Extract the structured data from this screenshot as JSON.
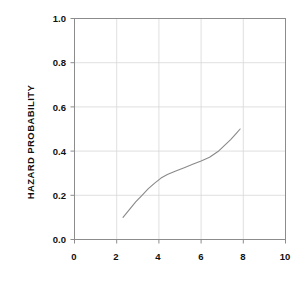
{
  "chart_data": {
    "type": "line",
    "title": "",
    "subtitle": "",
    "xlabel": "",
    "ylabel": "HAZARD PROBABILITY",
    "xlim": [
      0,
      10
    ],
    "ylim": [
      0.0,
      1.0
    ],
    "xticks": [
      "0",
      "2",
      "4",
      "6",
      "8",
      "10"
    ],
    "xtick_values": [
      0,
      2,
      4,
      6,
      8,
      10
    ],
    "yticks": [
      "0.0",
      "0.2",
      "0.4",
      "0.6",
      "0.8",
      "1.0"
    ],
    "ytick_values": [
      0.0,
      0.2,
      0.4,
      0.6,
      0.8,
      1.0
    ],
    "grid": true,
    "legend": "none",
    "line_color": "#8a8a8a",
    "frame_color": "#808080",
    "grid_color": "#d8d8d8",
    "series": [
      {
        "name": "hazard probability",
        "x": [
          2.3,
          2.6,
          2.9,
          3.2,
          3.5,
          3.8,
          4.1,
          4.4,
          4.8,
          5.2,
          5.6,
          6.0,
          6.4,
          6.8,
          7.1,
          7.4,
          7.7,
          7.85
        ],
        "values": [
          0.1,
          0.135,
          0.17,
          0.2,
          0.23,
          0.255,
          0.278,
          0.294,
          0.31,
          0.325,
          0.34,
          0.355,
          0.372,
          0.398,
          0.425,
          0.452,
          0.484,
          0.5
        ]
      }
    ]
  },
  "axes": {
    "x_axis_name": "x-axis",
    "y_axis_name": "y-axis"
  }
}
